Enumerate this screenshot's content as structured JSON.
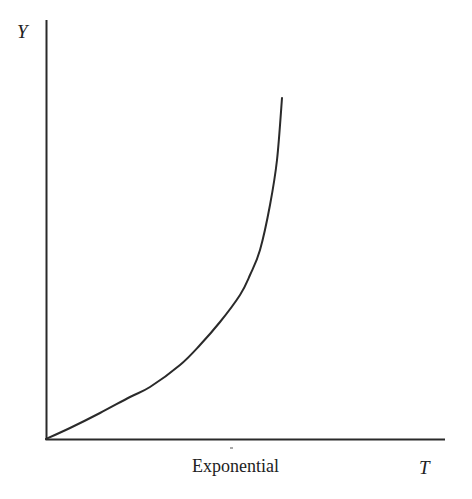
{
  "chart_data": {
    "type": "line",
    "title": "",
    "caption": "Exponential",
    "xlabel": "T",
    "ylabel": "Y",
    "grid": false,
    "legend": null,
    "axis_ticks": false,
    "series": [
      {
        "name": "Exponential",
        "description": "Convex, exponentially increasing curve starting at the origin",
        "points_px": [
          [
            46,
            439
          ],
          [
            70,
            428
          ],
          [
            100,
            413
          ],
          [
            130,
            397
          ],
          [
            150,
            387
          ],
          [
            180,
            365
          ],
          [
            200,
            345
          ],
          [
            220,
            322
          ],
          [
            240,
            295
          ],
          [
            250,
            275
          ],
          [
            260,
            250
          ],
          [
            270,
            205
          ],
          [
            277,
            160
          ],
          [
            282,
            98
          ]
        ],
        "x_norm": [
          0.0,
          0.06,
          0.14,
          0.21,
          0.26,
          0.34,
          0.39,
          0.44,
          0.49,
          0.51,
          0.54,
          0.56,
          0.58,
          0.59
        ],
        "y_norm": [
          0.0,
          0.03,
          0.06,
          0.1,
          0.12,
          0.18,
          0.22,
          0.28,
          0.35,
          0.39,
          0.45,
          0.56,
          0.67,
          0.82
        ]
      }
    ],
    "axes": {
      "origin_px": [
        46,
        439
      ],
      "y_axis_top_px": [
        46,
        20
      ],
      "x_axis_end_px": [
        445,
        439
      ]
    }
  },
  "labels": {
    "y_axis": "Y",
    "x_axis": "T",
    "caption": "Exponential"
  },
  "colors": {
    "ink": "#2a2a2a",
    "background": "#ffffff"
  }
}
